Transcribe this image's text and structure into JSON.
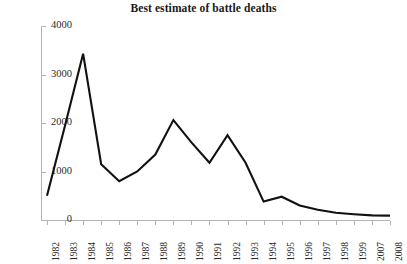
{
  "chart_data": {
    "type": "line",
    "title": "Best estimate of battle deaths",
    "xlabel": "",
    "ylabel": "",
    "categories": [
      "1982",
      "1983",
      "1984",
      "1985",
      "1986",
      "1987",
      "1988",
      "1989",
      "1990",
      "1991",
      "1992",
      "1993",
      "1994",
      "1995",
      "1996",
      "1997",
      "1998",
      "1999",
      "2007",
      "2008"
    ],
    "values": [
      500,
      1950,
      3430,
      1150,
      800,
      1000,
      1350,
      2060,
      1600,
      1180,
      1750,
      1180,
      380,
      480,
      300,
      210,
      150,
      120,
      95,
      90
    ],
    "series": [
      {
        "name": "Best estimate of battle deaths",
        "values": [
          500,
          1950,
          3430,
          1150,
          800,
          1000,
          1350,
          2060,
          1600,
          1180,
          1750,
          1180,
          380,
          480,
          300,
          210,
          150,
          120,
          95,
          90
        ]
      }
    ],
    "ylim": [
      0,
      4000
    ],
    "yticks": [
      0,
      1000,
      2000,
      3000,
      4000
    ],
    "ytick_labels": [
      "0",
      "1000",
      "2000",
      "3000",
      "4000"
    ],
    "grid": false,
    "legend": false,
    "legend_position": "none",
    "line_color": "#111111",
    "axis_color": "#b4b4b4",
    "background_color": "#ffffff",
    "xtick_rotation": -90,
    "note": "x-axis categories skip the years 2000 through 2006"
  }
}
